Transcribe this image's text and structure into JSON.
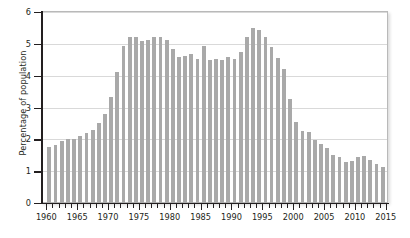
{
  "chart_data": {
    "type": "bar",
    "title": "",
    "subtitle": "",
    "xlabel": "",
    "ylabel": "Percentage of population",
    "xlim": [
      1959.3,
      2015.2
    ],
    "ylim": [
      0,
      6
    ],
    "ytick_values": [
      0,
      1,
      2,
      3,
      4,
      5,
      6
    ],
    "ytick_labels": [
      "0",
      "1",
      "2",
      "3",
      "4",
      "5",
      "6"
    ],
    "xtick_values": [
      1960,
      1965,
      1970,
      1975,
      1980,
      1985,
      1990,
      1995,
      2000,
      2005,
      2010,
      2015
    ],
    "xtick_labels": [
      "1960",
      "1965",
      "1970",
      "1975",
      "1980",
      "1985",
      "1990",
      "1995",
      "2000",
      "2005",
      "2010",
      "2015"
    ],
    "minor_xticks_every": 1,
    "grid": "horizontal",
    "legend": "none",
    "bar_color": "#a9a9a9",
    "axis_color": "#231f20",
    "gridline_color": "#d9d9d9",
    "frame_color": "#b9b9b9",
    "categories": [
      "1960",
      "1961",
      "1962",
      "1963",
      "1964",
      "1965",
      "1966",
      "1967",
      "1968",
      "1969",
      "1970",
      "1971",
      "1972",
      "1973",
      "1974",
      "1975",
      "1976",
      "1977",
      "1978",
      "1979",
      "1980",
      "1981",
      "1982",
      "1983",
      "1984",
      "1985",
      "1986",
      "1987",
      "1988",
      "1989",
      "1990",
      "1991",
      "1992",
      "1993",
      "1994",
      "1995",
      "1996",
      "1997",
      "1998",
      "1999",
      "2000",
      "2001",
      "2002",
      "2003",
      "2004",
      "2005",
      "2006",
      "2007",
      "2008",
      "2009",
      "2010",
      "2011",
      "2012",
      "2013",
      "2014"
    ],
    "values": [
      1.75,
      1.82,
      1.95,
      2.0,
      2.0,
      2.1,
      2.2,
      2.3,
      2.52,
      2.8,
      3.32,
      4.12,
      4.92,
      5.2,
      5.22,
      5.08,
      5.13,
      5.22,
      5.23,
      5.12,
      4.83,
      4.6,
      4.62,
      4.68,
      4.52,
      4.92,
      4.5,
      4.52,
      4.5,
      4.6,
      4.52,
      4.75,
      5.2,
      5.5,
      5.43,
      5.22,
      4.9,
      4.55,
      4.2,
      3.28,
      2.55,
      2.25,
      2.22,
      1.98,
      1.85,
      1.72,
      1.52,
      1.45,
      1.3,
      1.32,
      1.45,
      1.48,
      1.35,
      1.22,
      1.12
    ]
  }
}
